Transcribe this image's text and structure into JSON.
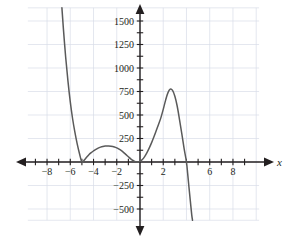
{
  "chart_data": {
    "type": "line",
    "title": "",
    "subtitle": "",
    "xlabel": "x",
    "ylabel": "",
    "xlim": [
      -9.6,
      10.2
    ],
    "ylim": [
      -620,
      1640
    ],
    "grid": true,
    "grid_x_step": 2,
    "grid_y_step": 250,
    "legend": null,
    "x_ticks": [
      -9,
      -8,
      -7,
      -6,
      -5,
      -4,
      -3,
      -2,
      -1,
      1,
      2,
      3,
      4,
      5,
      6,
      7,
      8,
      9
    ],
    "x_tick_labels": [
      {
        "value": -8,
        "label": "−8"
      },
      {
        "value": -6,
        "label": "−6"
      },
      {
        "value": -4,
        "label": "−4"
      },
      {
        "value": -2,
        "label": "−2"
      },
      {
        "value": 2,
        "label": "2"
      },
      {
        "value": 6,
        "label": "6"
      },
      {
        "value": 8,
        "label": "8"
      }
    ],
    "y_ticks": [
      -500,
      -375,
      -250,
      -125,
      125,
      250,
      375,
      500,
      625,
      750,
      875,
      1000,
      1125,
      1250,
      1375,
      1500
    ],
    "y_tick_labels": [
      {
        "value": 1500,
        "label": "1500"
      },
      {
        "value": 1250,
        "label": "1250"
      },
      {
        "value": 1000,
        "label": "1000"
      },
      {
        "value": 750,
        "label": "750"
      },
      {
        "value": 500,
        "label": "500"
      },
      {
        "value": 250,
        "label": "250"
      },
      {
        "value": -250,
        "label": "−250"
      },
      {
        "value": -500,
        "label": "−500"
      }
    ],
    "series": [
      {
        "name": "polynomial",
        "color": "#5a5a5a",
        "roots": [
          {
            "x": -5.0,
            "multiplicity": 2
          },
          {
            "x": -0.2,
            "multiplicity": 2
          },
          {
            "x": 4.0,
            "multiplicity": 1
          }
        ],
        "local_extrema": [
          {
            "x": -5.0,
            "y": 0,
            "kind": "local-min"
          },
          {
            "x": -2.7,
            "y": 170,
            "kind": "local-max"
          },
          {
            "x": -0.2,
            "y": 0,
            "kind": "local-min"
          },
          {
            "x": 2.6,
            "y": 775,
            "kind": "local-max"
          }
        ],
        "end_behavior": {
          "left": "up",
          "right": "down"
        },
        "points": [
          {
            "x": -6.72,
            "y": 1640
          },
          {
            "x": -6.6,
            "y": 1430
          },
          {
            "x": -6.4,
            "y": 1120
          },
          {
            "x": -6.2,
            "y": 860
          },
          {
            "x": -6.0,
            "y": 640
          },
          {
            "x": -5.8,
            "y": 460
          },
          {
            "x": -5.6,
            "y": 315
          },
          {
            "x": -5.4,
            "y": 190
          },
          {
            "x": -5.2,
            "y": 85
          },
          {
            "x": -5.0,
            "y": 0
          },
          {
            "x": -4.8,
            "y": 20
          },
          {
            "x": -4.6,
            "y": 50
          },
          {
            "x": -4.4,
            "y": 78
          },
          {
            "x": -4.2,
            "y": 100
          },
          {
            "x": -4.0,
            "y": 118
          },
          {
            "x": -3.8,
            "y": 134
          },
          {
            "x": -3.6,
            "y": 148
          },
          {
            "x": -3.4,
            "y": 158
          },
          {
            "x": -3.2,
            "y": 165
          },
          {
            "x": -3.0,
            "y": 169
          },
          {
            "x": -2.7,
            "y": 170
          },
          {
            "x": -2.5,
            "y": 168
          },
          {
            "x": -2.2,
            "y": 160
          },
          {
            "x": -2.0,
            "y": 150
          },
          {
            "x": -1.8,
            "y": 136
          },
          {
            "x": -1.6,
            "y": 120
          },
          {
            "x": -1.4,
            "y": 100
          },
          {
            "x": -1.2,
            "y": 78
          },
          {
            "x": -1.0,
            "y": 56
          },
          {
            "x": -0.8,
            "y": 34
          },
          {
            "x": -0.6,
            "y": 16
          },
          {
            "x": -0.4,
            "y": 4
          },
          {
            "x": -0.2,
            "y": 0
          },
          {
            "x": 0.0,
            "y": 6
          },
          {
            "x": 0.2,
            "y": 26
          },
          {
            "x": 0.4,
            "y": 58
          },
          {
            "x": 0.6,
            "y": 100
          },
          {
            "x": 0.8,
            "y": 150
          },
          {
            "x": 1.0,
            "y": 206
          },
          {
            "x": 1.2,
            "y": 268
          },
          {
            "x": 1.4,
            "y": 334
          },
          {
            "x": 1.6,
            "y": 402
          },
          {
            "x": 1.8,
            "y": 472
          },
          {
            "x": 2.0,
            "y": 560
          },
          {
            "x": 2.2,
            "y": 656
          },
          {
            "x": 2.4,
            "y": 735
          },
          {
            "x": 2.6,
            "y": 775
          },
          {
            "x": 2.8,
            "y": 762
          },
          {
            "x": 3.0,
            "y": 700
          },
          {
            "x": 3.2,
            "y": 596
          },
          {
            "x": 3.4,
            "y": 452
          },
          {
            "x": 3.6,
            "y": 300
          },
          {
            "x": 3.8,
            "y": 140
          },
          {
            "x": 4.0,
            "y": 0
          },
          {
            "x": 4.1,
            "y": -120
          },
          {
            "x": 4.2,
            "y": -250
          },
          {
            "x": 4.32,
            "y": -400
          },
          {
            "x": 4.45,
            "y": -560
          },
          {
            "x": 4.52,
            "y": -620
          }
        ]
      }
    ]
  },
  "axes": {
    "x_axis_label": "x",
    "arrow_left": "◀",
    "arrow_right": "▶",
    "arrow_up": "▲",
    "arrow_down": "▼"
  },
  "style": {
    "curve_color": "#5a5a5a",
    "axis_color": "#231f20",
    "grid_color": "#d8dce8",
    "background": "#ffffff"
  }
}
